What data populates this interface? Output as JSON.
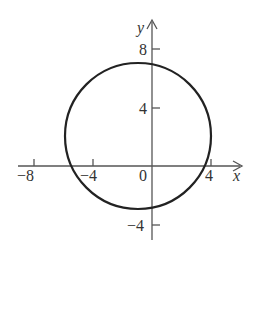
{
  "figure": {
    "cropped_caption": "",
    "axes": {
      "x_label": "x",
      "y_label": "y",
      "x_ticks": [
        {
          "value": -8,
          "label": "−8"
        },
        {
          "value": -4,
          "label": "−4"
        },
        {
          "value": 0,
          "label": "0"
        },
        {
          "value": 4,
          "label": "4"
        }
      ],
      "y_ticks": [
        {
          "value": 8,
          "label": "8"
        },
        {
          "value": 4,
          "label": "4"
        },
        {
          "value": -4,
          "label": "−4"
        }
      ]
    },
    "curve": {
      "type": "circle",
      "center": [
        -1,
        2
      ],
      "radius": 5,
      "color": "#222222"
    },
    "axis_color": "#555555"
  }
}
